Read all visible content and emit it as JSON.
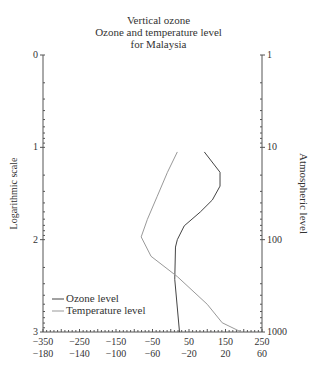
{
  "title": [
    "Vertical ozone",
    "Ozone and temperature level",
    "for Malaysia"
  ],
  "chart_data": {
    "type": "line",
    "ylabel_left": "Logarithmic scale",
    "ylabel_right": "Atmospheric level",
    "left_ticks": [
      "0",
      "1",
      "2",
      "3"
    ],
    "right_ticks": [
      "1",
      "10",
      "100",
      "1000"
    ],
    "x_ticks_top": [
      "-350",
      "-250",
      "-150",
      "-50",
      "50",
      "150",
      "250"
    ],
    "x_ticks_bottom": [
      "-180",
      "-140",
      "-100",
      "-60",
      "-20",
      "20",
      "60"
    ],
    "legend": [
      "Ozone level",
      "Temperature level"
    ],
    "series": [
      {
        "name": "Ozone level",
        "points": [
          [
            92,
            1.05
          ],
          [
            135,
            1.27
          ],
          [
            135,
            1.42
          ],
          [
            114,
            1.57
          ],
          [
            81,
            1.7
          ],
          [
            37,
            1.85
          ],
          [
            18,
            2.0
          ],
          [
            13,
            2.08
          ],
          [
            11,
            2.43
          ],
          [
            24,
            3.0
          ]
        ]
      },
      {
        "name": "Temperature level",
        "points": [
          [
            18,
            1.05
          ],
          [
            -9,
            1.27
          ],
          [
            -37,
            1.53
          ],
          [
            -64,
            1.78
          ],
          [
            -81,
            1.97
          ],
          [
            -54,
            2.18
          ],
          [
            18,
            2.4
          ],
          [
            100,
            2.7
          ],
          [
            141,
            2.9
          ],
          [
            193,
            3.0
          ]
        ]
      }
    ]
  }
}
